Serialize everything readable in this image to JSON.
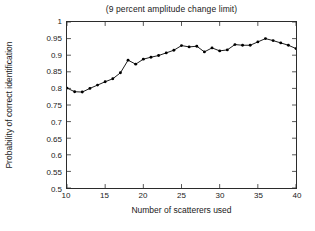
{
  "chart_data": {
    "type": "line",
    "title": "(9 percent amplitude change limit)",
    "xlabel": "Number of scatterers used",
    "ylabel": "Probability of correct identification",
    "xlim": [
      10,
      40
    ],
    "ylim": [
      0.5,
      1
    ],
    "xticks": [
      10,
      15,
      20,
      25,
      30,
      35,
      40
    ],
    "xtick_labels": [
      "10",
      "15",
      "20",
      "25",
      "30",
      "35",
      "40"
    ],
    "yticks": [
      0.5,
      0.55,
      0.6,
      0.65,
      0.7,
      0.75,
      0.8,
      0.85,
      0.9,
      0.95,
      1
    ],
    "ytick_labels": [
      "0.5",
      "0.55",
      "0.6",
      "0.65",
      "0.7",
      "0.75",
      "0.8",
      "0.85",
      "0.9",
      "0.95",
      "1"
    ],
    "grid": false,
    "legend": null,
    "marker": "filled-circle",
    "line_color": "#000000",
    "marker_color": "#000000",
    "x": [
      10,
      11,
      12,
      13,
      14,
      15,
      16,
      17,
      18,
      19,
      20,
      21,
      22,
      23,
      24,
      25,
      26,
      27,
      28,
      29,
      30,
      31,
      32,
      33,
      34,
      35,
      36,
      37,
      38,
      39,
      40
    ],
    "values": [
      0.801,
      0.79,
      0.789,
      0.8,
      0.81,
      0.82,
      0.829,
      0.847,
      0.885,
      0.873,
      0.888,
      0.894,
      0.899,
      0.907,
      0.915,
      0.929,
      0.925,
      0.927,
      0.91,
      0.922,
      0.913,
      0.916,
      0.932,
      0.93,
      0.93,
      0.94,
      0.95,
      0.944,
      0.937,
      0.93,
      0.92
    ],
    "series": [
      {
        "name": "probability-of-correct-identification",
        "values": [
          0.801,
          0.79,
          0.789,
          0.8,
          0.81,
          0.82,
          0.829,
          0.847,
          0.885,
          0.873,
          0.888,
          0.894,
          0.899,
          0.907,
          0.915,
          0.929,
          0.925,
          0.927,
          0.91,
          0.922,
          0.913,
          0.916,
          0.932,
          0.93,
          0.93,
          0.94,
          0.95,
          0.944,
          0.937,
          0.93,
          0.92
        ]
      }
    ]
  }
}
